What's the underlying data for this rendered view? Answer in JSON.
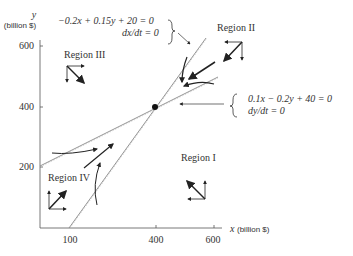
{
  "axes": {
    "y_label": "y",
    "y_unit": "(billion $)",
    "x_label": "x",
    "x_unit": "(billion $)",
    "y_ticks": [
      "600",
      "400",
      "200"
    ],
    "x_ticks": [
      "100",
      "400",
      "600"
    ]
  },
  "equations": {
    "dx_line": "−0.2x + 0.15y + 20 = 0",
    "dx_cond": "dx/dt = 0",
    "dy_line": "0.1x − 0.2y + 40 = 0",
    "dy_cond": "dy/dt = 0"
  },
  "regions": {
    "r1": "Region I",
    "r2": "Region II",
    "r3": "Region III",
    "r4": "Region IV"
  },
  "equilibrium": {
    "x": 400,
    "y": 400
  }
}
